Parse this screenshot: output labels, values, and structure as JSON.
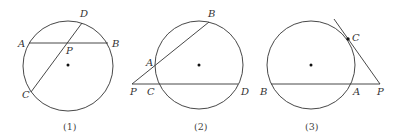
{
  "figures": [
    {
      "caption": "(1)",
      "labels": {
        "A": "A",
        "B": "B",
        "C": "C",
        "D": "D",
        "P": "P"
      }
    },
    {
      "caption": "(2)",
      "labels": {
        "A": "A",
        "B": "B",
        "C": "C",
        "D": "D",
        "P": "P"
      }
    },
    {
      "caption": "(3)",
      "labels": {
        "A": "A",
        "B": "B",
        "C": "C",
        "P": "P"
      }
    }
  ],
  "colors": {
    "stroke": "#333333",
    "background": "#ffffff"
  }
}
